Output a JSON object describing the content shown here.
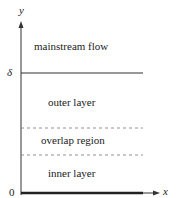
{
  "diagram": {
    "axes": {
      "y_label": "y",
      "x_label": "x",
      "origin_label": "0",
      "delta_label": "δ"
    },
    "regions": [
      {
        "name": "mainstream",
        "label": "mainstream flow"
      },
      {
        "name": "outer",
        "label": "outer layer"
      },
      {
        "name": "overlap",
        "label": "overlap region"
      },
      {
        "name": "inner",
        "label": "inner layer"
      }
    ],
    "boundaries": [
      {
        "at": "delta",
        "style": "solid"
      },
      {
        "between": "outer-overlap",
        "style": "dashed"
      },
      {
        "between": "overlap-inner",
        "style": "dashed"
      },
      {
        "at": "wall",
        "style": "thick solid"
      }
    ],
    "colors": {
      "line": "#333333",
      "dashed": "#777777",
      "text": "#222222"
    }
  }
}
